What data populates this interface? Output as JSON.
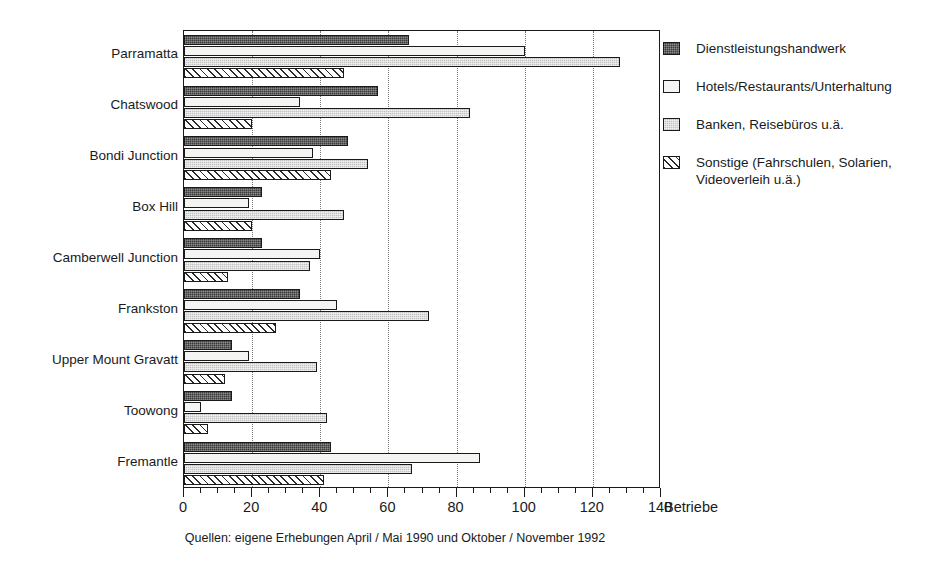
{
  "chart_data": {
    "type": "bar",
    "orientation": "horizontal",
    "title": "",
    "xlabel": "Betriebe",
    "ylabel": "",
    "xlim": [
      0,
      140
    ],
    "xticks": [
      0,
      20,
      40,
      60,
      80,
      100,
      120,
      140
    ],
    "xtick_labels": [
      "0",
      "20",
      "40",
      "60",
      "80",
      "100",
      "120",
      "140"
    ],
    "minor_tick_step": 5,
    "grid": "vertical-dotted-at-major-ticks",
    "legend_position": "right",
    "categories": [
      "Parramatta",
      "Chatswood",
      "Bondi Junction",
      "Box Hill",
      "Camberwell Junction",
      "Frankston",
      "Upper Mount Gravatt",
      "Toowong",
      "Fremantle"
    ],
    "series": [
      {
        "name": "Dienstleistungshandwerk",
        "fill": "dark-dither",
        "color": "#3a3a3a",
        "values": [
          66,
          57,
          48,
          23,
          23,
          34,
          14,
          14,
          43
        ]
      },
      {
        "name": "Hotels/Restaurants/Unterhaltung",
        "fill": "white",
        "color": "#f4f4f2",
        "values": [
          100,
          34,
          38,
          19,
          40,
          45,
          19,
          5,
          87
        ]
      },
      {
        "name": "Banken, Reisebüros u.ä.",
        "fill": "light-gray-dot",
        "color": "#c2c2c2",
        "values": [
          128,
          84,
          54,
          47,
          37,
          72,
          39,
          42,
          67
        ]
      },
      {
        "name": "Sonstige (Fahrschulen, Solarien,\nVideoverleih u.ä.)",
        "fill": "diagonal-hatch",
        "color": "#ffffff",
        "values": [
          47,
          20,
          43,
          20,
          13,
          27,
          12,
          7,
          41
        ]
      }
    ],
    "caption": "Quellen: eigene Erhebungen April / Mai 1990 und Oktober / November 1992"
  },
  "legend": {
    "items": [
      "Dienstleistungshandwerk",
      "Hotels/Restaurants/Unterhaltung",
      "Banken, Reisebüros u.ä.",
      "Sonstige (Fahrschulen, Solarien,\nVideoverleih u.ä.)"
    ]
  }
}
